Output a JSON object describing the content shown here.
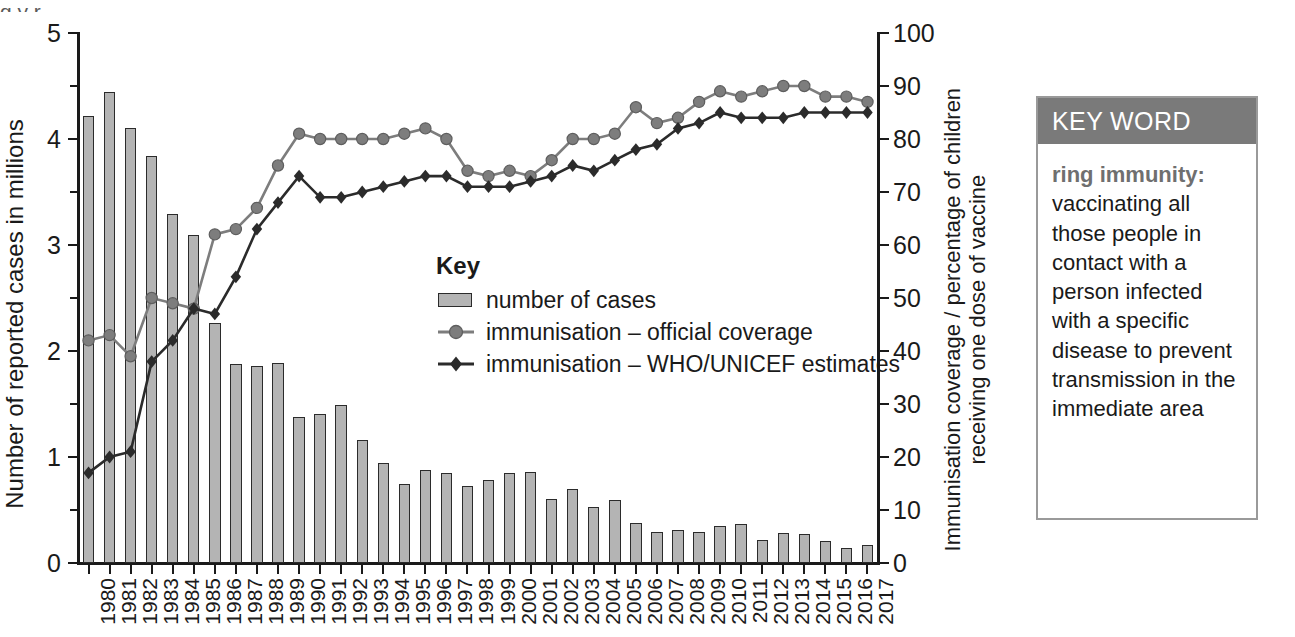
{
  "figure": {
    "top_cut_text": "g                                    y                       r"
  },
  "chart_data": {
    "type": "bar",
    "title": "",
    "xlabel": "",
    "ylabel": "Number of reported cases in millions",
    "y2label": "Immunisation coverage / percentage of children receiving one dose of vaccine",
    "ylim": [
      0,
      5
    ],
    "y2lim": [
      0,
      100
    ],
    "yticks": [
      0,
      1,
      2,
      3,
      4,
      5
    ],
    "yticks_minor": [
      0.5,
      1.5,
      2.5,
      3.5,
      4.5
    ],
    "y2ticks": [
      0,
      10,
      20,
      30,
      40,
      50,
      60,
      70,
      80,
      90,
      100
    ],
    "grid": false,
    "legend_position": "inside-center",
    "categories": [
      "1980",
      "1981",
      "1982",
      "1983",
      "1984",
      "1985",
      "1986",
      "1987",
      "1988",
      "1989",
      "1990",
      "1991",
      "1992",
      "1993",
      "1994",
      "1995",
      "1996",
      "1997",
      "1998",
      "1999",
      "2000",
      "2001",
      "2002",
      "2003",
      "2004",
      "2005",
      "2006",
      "2007",
      "2008",
      "2009",
      "2010",
      "2011",
      "2012",
      "2013",
      "2014",
      "2015",
      "2016",
      "2017"
    ],
    "series": [
      {
        "name": "number of cases",
        "type": "bar",
        "axis": "left",
        "unit": "millions",
        "color": "#b4b4b4",
        "edge_color": "#2b2b2b",
        "values": [
          4.22,
          4.44,
          4.1,
          3.84,
          3.29,
          3.09,
          2.26,
          1.88,
          1.86,
          1.89,
          1.38,
          1.41,
          1.49,
          1.16,
          0.94,
          0.75,
          0.88,
          0.85,
          0.73,
          0.78,
          0.85,
          0.86,
          0.6,
          0.7,
          0.53,
          0.59,
          0.38,
          0.29,
          0.31,
          0.29,
          0.35,
          0.37,
          0.22,
          0.28,
          0.27,
          0.21,
          0.14,
          0.17
        ]
      },
      {
        "name": "immunisation – official coverage",
        "type": "line",
        "axis": "right",
        "unit": "%",
        "color": "#7d7d7d",
        "marker": "circle",
        "values": [
          42,
          43,
          39,
          50,
          49,
          48,
          62,
          63,
          67,
          75,
          81,
          80,
          80,
          80,
          80,
          81,
          82,
          80,
          74,
          73,
          74,
          73,
          76,
          80,
          80,
          81,
          86,
          83,
          84,
          87,
          89,
          88,
          89,
          90,
          90,
          88,
          88,
          87
        ]
      },
      {
        "name": "immunisation – WHO/UNICEF estimates",
        "type": "line",
        "axis": "right",
        "unit": "%",
        "color": "#2b2b2b",
        "marker": "diamond",
        "values": [
          17,
          20,
          21,
          38,
          42,
          48,
          47,
          54,
          63,
          68,
          73,
          69,
          69,
          70,
          71,
          72,
          73,
          73,
          71,
          71,
          71,
          72,
          73,
          75,
          74,
          76,
          78,
          79,
          82,
          83,
          85,
          84,
          84,
          84,
          85,
          85,
          85,
          85
        ]
      }
    ]
  },
  "key": {
    "title": "Key",
    "items": [
      {
        "label": "number of cases",
        "marker": "bar-swatch"
      },
      {
        "label": "immunisation – official coverage",
        "marker": "circle-line"
      },
      {
        "label": "immunisation – WHO/UNICEF estimates",
        "marker": "diamond-line"
      }
    ]
  },
  "keyword_box": {
    "header": "KEY WORD",
    "term": "ring immunity:",
    "definition": "vaccinating all those people in contact with a person infected with a specific disease to prevent transmission in the immediate area",
    "header_bg": "#7a7a7a",
    "border": "#9a9a9a"
  }
}
